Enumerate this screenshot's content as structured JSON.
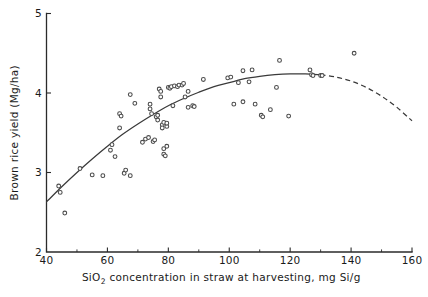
{
  "chart_data": {
    "type": "scatter",
    "title": "",
    "xlabel": "SiO2 concentration in straw at harvesting, mg Si/g",
    "xlabel_main": "SiO",
    "xlabel_sub": "2",
    "xlabel_rest": " concentration in straw at harvesting, mg Si/g",
    "ylabel": "Brown rice yield  (Mg/ha)",
    "xlim": [
      40,
      160
    ],
    "ylim": [
      2,
      5
    ],
    "xticks": [
      40,
      60,
      80,
      100,
      120,
      140,
      160
    ],
    "xtick_labels": [
      "40",
      "60",
      "80",
      "100",
      "120",
      "140",
      "160"
    ],
    "x_minor_step": 10,
    "yticks": [
      2,
      3,
      4,
      5
    ],
    "ytick_labels": [
      "2",
      "3",
      "4",
      "5"
    ],
    "grid": false,
    "legend": "none",
    "marker_style": "open-circle",
    "points": [
      [
        44.0,
        2.83
      ],
      [
        44.5,
        2.75
      ],
      [
        46.0,
        2.49
      ],
      [
        51.0,
        3.05
      ],
      [
        55.0,
        2.97
      ],
      [
        58.5,
        2.96
      ],
      [
        61.0,
        3.28
      ],
      [
        61.5,
        3.35
      ],
      [
        62.5,
        3.2
      ],
      [
        64.0,
        3.74
      ],
      [
        64.5,
        3.71
      ],
      [
        64.0,
        3.56
      ],
      [
        65.5,
        2.99
      ],
      [
        66.0,
        3.03
      ],
      [
        67.5,
        2.96
      ],
      [
        67.5,
        3.98
      ],
      [
        69.0,
        3.87
      ],
      [
        71.5,
        3.38
      ],
      [
        72.5,
        3.42
      ],
      [
        73.5,
        3.44
      ],
      [
        74.0,
        3.8
      ],
      [
        74.5,
        3.74
      ],
      [
        74.0,
        3.86
      ],
      [
        75.0,
        3.39
      ],
      [
        75.5,
        3.41
      ],
      [
        76.0,
        3.7
      ],
      [
        76.5,
        3.66
      ],
      [
        76.5,
        3.72
      ],
      [
        77.0,
        4.05
      ],
      [
        77.5,
        3.95
      ],
      [
        77.5,
        4.02
      ],
      [
        78.0,
        3.6
      ],
      [
        78.5,
        3.63
      ],
      [
        78.0,
        3.56
      ],
      [
        78.5,
        3.3
      ],
      [
        78.5,
        3.23
      ],
      [
        79.0,
        3.21
      ],
      [
        79.5,
        3.33
      ],
      [
        79.5,
        3.58
      ],
      [
        79.5,
        3.62
      ],
      [
        80.0,
        4.07
      ],
      [
        80.5,
        4.06
      ],
      [
        81.0,
        4.08
      ],
      [
        81.5,
        3.84
      ],
      [
        82.0,
        4.09
      ],
      [
        83.0,
        4.08
      ],
      [
        83.5,
        4.1
      ],
      [
        84.5,
        4.1
      ],
      [
        85.0,
        4.12
      ],
      [
        85.5,
        3.95
      ],
      [
        86.5,
        4.02
      ],
      [
        86.5,
        3.82
      ],
      [
        88.0,
        3.84
      ],
      [
        88.5,
        3.83
      ],
      [
        91.5,
        4.17
      ],
      [
        99.5,
        4.19
      ],
      [
        100.5,
        4.2
      ],
      [
        101.5,
        3.86
      ],
      [
        103.0,
        4.13
      ],
      [
        104.5,
        4.28
      ],
      [
        104.5,
        3.89
      ],
      [
        106.5,
        4.14
      ],
      [
        107.5,
        4.29
      ],
      [
        108.5,
        3.86
      ],
      [
        110.5,
        3.72
      ],
      [
        111.0,
        3.7
      ],
      [
        113.5,
        3.79
      ],
      [
        115.5,
        4.07
      ],
      [
        116.5,
        4.41
      ],
      [
        119.5,
        3.71
      ],
      [
        126.5,
        4.29
      ],
      [
        127.0,
        4.23
      ],
      [
        127.5,
        4.22
      ],
      [
        130.0,
        4.22
      ],
      [
        130.5,
        4.22
      ],
      [
        141.0,
        4.5
      ]
    ],
    "fit_curve_solid": [
      [
        40.0,
        2.63
      ],
      [
        45.0,
        2.82
      ],
      [
        50.0,
        3.0
      ],
      [
        55.0,
        3.17
      ],
      [
        60.0,
        3.33
      ],
      [
        65.0,
        3.48
      ],
      [
        70.0,
        3.61
      ],
      [
        75.0,
        3.73
      ],
      [
        80.0,
        3.84
      ],
      [
        85.0,
        3.93
      ],
      [
        90.0,
        4.01
      ],
      [
        95.0,
        4.08
      ],
      [
        100.0,
        4.13
      ],
      [
        105.0,
        4.18
      ],
      [
        110.0,
        4.21
      ],
      [
        115.0,
        4.23
      ],
      [
        120.0,
        4.24
      ],
      [
        125.0,
        4.24
      ],
      [
        130.0,
        4.23
      ]
    ],
    "fit_curve_dashed": [
      [
        130.0,
        4.23
      ],
      [
        135.0,
        4.2
      ],
      [
        140.0,
        4.15
      ],
      [
        145.0,
        4.07
      ],
      [
        150.0,
        3.96
      ],
      [
        155.0,
        3.82
      ],
      [
        160.0,
        3.65
      ]
    ]
  },
  "colors": {
    "axis": "#2b2b2b",
    "curve": "#3a3a3a",
    "marker_stroke": "#4a4a4a",
    "background": "#ffffff",
    "text": "#1a1a1a"
  }
}
